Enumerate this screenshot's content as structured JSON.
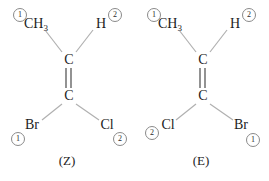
{
  "diagram": {
    "bond_color": "#b0b0b0",
    "text_color": "#1d1d1d",
    "circle_color": "#8a8a8a",
    "background": "#ffffff"
  },
  "structures": [
    {
      "id": "z-isomer",
      "caption": "(Z)",
      "center_top": "C",
      "center_bottom": "C",
      "bond_label": "double-bond",
      "substituents": {
        "top_left": {
          "element": "CH",
          "subscript": "3",
          "priority": "1"
        },
        "top_right": {
          "element": "H",
          "subscript": "",
          "priority": "2"
        },
        "bottom_left": {
          "element": "Br",
          "subscript": "",
          "priority": "1"
        },
        "bottom_right": {
          "element": "Cl",
          "subscript": "",
          "priority": "2"
        }
      }
    },
    {
      "id": "e-isomer",
      "caption": "(E)",
      "center_top": "C",
      "center_bottom": "C",
      "bond_label": "double-bond",
      "substituents": {
        "top_left": {
          "element": "CH",
          "subscript": "3",
          "priority": "1"
        },
        "top_right": {
          "element": "H",
          "subscript": "",
          "priority": "2"
        },
        "bottom_left": {
          "element": "Cl",
          "subscript": "",
          "priority": "2"
        },
        "bottom_right": {
          "element": "Br",
          "subscript": "",
          "priority": "1"
        }
      }
    }
  ]
}
